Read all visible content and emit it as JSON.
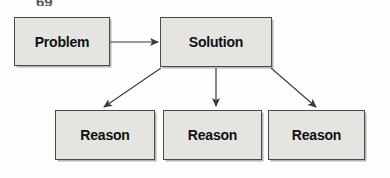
{
  "diagram": {
    "type": "flowchart",
    "title_fragment": "69",
    "background_color": "#fdfdfc",
    "node_fill_color": "#e4e4e1",
    "node_border_color": "#4a4a4a",
    "text_color": "#101010",
    "arrow_color": "#3a3a3a",
    "nodes": [
      {
        "id": "problem",
        "label": "Problem"
      },
      {
        "id": "solution",
        "label": "Solution"
      },
      {
        "id": "reason1",
        "label": "Reason"
      },
      {
        "id": "reason2",
        "label": "Reason"
      },
      {
        "id": "reason3",
        "label": "Reason"
      }
    ],
    "edges": [
      {
        "from": "problem",
        "to": "reason0",
        "label": ""
      },
      {
        "from": "solution",
        "to": "reason1",
        "label": ""
      },
      {
        "from": "solution",
        "to": "reason2",
        "label": ""
      },
      {
        "from": "solution",
        "to": "reason3",
        "label": ""
      }
    ]
  }
}
